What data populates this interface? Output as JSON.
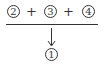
{
  "diagram": {
    "top_row": [
      {
        "type": "circled-number",
        "label": "2"
      },
      {
        "type": "operator",
        "label": "+"
      },
      {
        "type": "circled-number",
        "label": "3"
      },
      {
        "type": "operator",
        "label": "+"
      },
      {
        "type": "circled-number",
        "label": "4"
      }
    ],
    "result": {
      "type": "circled-number",
      "label": "1"
    },
    "arrow_direction": "down",
    "stroke_color": "#333333"
  }
}
